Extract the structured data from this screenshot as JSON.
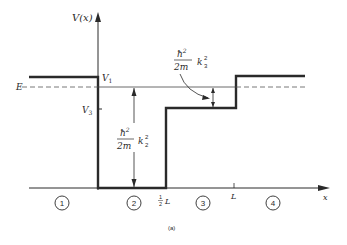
{
  "diagram": {
    "type": "potential-step-diagram",
    "y_axis_label": "V(x)",
    "x_axis_label": "x",
    "level_labels": {
      "v1": "V",
      "v1_sub": "1",
      "v3": "V",
      "v3_sub": "3",
      "energy": "E"
    },
    "x_tick_labels": {
      "half_L_num": "1",
      "half_L_den": "2",
      "half_L": "L",
      "L": "L"
    },
    "regions": [
      "1",
      "2",
      "3",
      "4"
    ],
    "annotations": {
      "k2": {
        "numerator": "ħ",
        "num_sup": "2",
        "denominator": "2m",
        "k": "k",
        "k_sub": "2",
        "k_sup": "2"
      },
      "k3": {
        "numerator": "ħ",
        "num_sup": "2",
        "denominator": "2m",
        "k": "k",
        "k_sub": "3",
        "k_sup": "2"
      }
    },
    "caption": "(a)"
  }
}
